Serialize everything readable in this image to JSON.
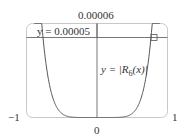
{
  "chart_data": {
    "type": "line",
    "title": "",
    "xlabel": "",
    "ylabel": "",
    "xlim": [
      -1,
      1
    ],
    "ylim": [
      0,
      6e-05
    ],
    "tick_labels": {
      "x_left": "−1",
      "x_center": "0",
      "x_right": "1",
      "y_top": "0.00006"
    },
    "series": [
      {
        "name": "y = |R6(x)|",
        "label_text": "y = |R",
        "label_sub": "6",
        "label_tail": "(x)|",
        "x": [
          -1.0,
          -0.95,
          -0.9,
          -0.85,
          -0.8,
          -0.7,
          -0.6,
          -0.5,
          -0.4,
          -0.3,
          -0.2,
          0.0,
          0.2,
          0.3,
          0.4,
          0.5,
          0.6,
          0.7,
          0.8,
          0.85,
          0.9,
          0.95,
          1.0
        ],
        "y": [
          0.000199,
          0.000146,
          0.000106,
          7.52e-05,
          5.21e-05,
          2.34e-05,
          9.3e-06,
          3.1e-06,
          8e-07,
          1.5e-07,
          1e-08,
          0.0,
          1e-08,
          1.5e-07,
          8e-07,
          3.1e-06,
          9.3e-06,
          2.34e-05,
          5.21e-05,
          7.52e-05,
          0.000106,
          0.000146,
          0.000199
        ]
      },
      {
        "name": "y = 0.00005",
        "label_text": "y = 0.00005",
        "constant": 5e-05
      }
    ],
    "annotations": [
      "intersection marker at x ≈ 0.79, y = 0.00005"
    ],
    "grid": false,
    "legend": "none"
  }
}
